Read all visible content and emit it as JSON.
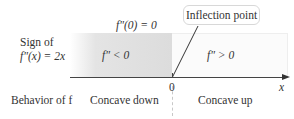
{
  "diagram": {
    "row_label_sign_line1": "Sign of",
    "row_label_sign_line2": "f″(x) = 2x",
    "row_label_behavior": "Behavior of f",
    "condition_at_zero": "f″(0) = 0",
    "callout": "Inflection point",
    "region_negative": {
      "sign_text": "f″ < 0",
      "behavior": "Concave down",
      "fill_color": "#dcdcdc"
    },
    "region_positive": {
      "sign_text": "f″ > 0",
      "behavior": "Concave up",
      "fill_color": "#fbfbfb"
    },
    "axis": {
      "variable": "x",
      "tick_label": "0"
    }
  }
}
